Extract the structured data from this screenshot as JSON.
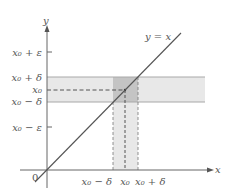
{
  "diagram": {
    "title": "",
    "axes": {
      "x_label": "x",
      "y_label": "y",
      "origin_label": "0"
    },
    "line_label": "y = x",
    "y_ticks": [
      {
        "label": "x₀ + ε",
        "y": 52
      },
      {
        "label": "x₀ + δ",
        "y": 77
      },
      {
        "label": "x₀",
        "y": 90
      },
      {
        "label": "x₀ − δ",
        "y": 102
      },
      {
        "label": "x₀ − ε",
        "y": 127
      }
    ],
    "x_ticks": [
      {
        "label": "x₀ − δ",
        "x": 113
      },
      {
        "label": "x₀",
        "x": 125
      },
      {
        "label": "x₀ + δ",
        "x": 138
      }
    ],
    "colors": {
      "axis": "#555555",
      "line": "#555555",
      "band_light": "#e8e8e8",
      "band_overlap": "#c4c4c4",
      "band_border": "#a8a8a8",
      "dashed": "#444444"
    }
  }
}
